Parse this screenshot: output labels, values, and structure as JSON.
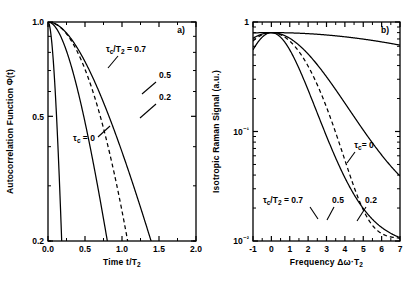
{
  "figure": {
    "panel_a_label": "a)",
    "panel_b_label": "b)"
  },
  "chart_data": [
    {
      "type": "line",
      "panel": "a)",
      "title": "",
      "xlabel": "Time t/T",
      "xlabel_sub": "2",
      "xlabel_full": "Time t/T₂",
      "ylabel": "Autocorrelation Function Φ(t)",
      "xlim": [
        0.0,
        2.0
      ],
      "ylim": [
        0.2,
        1.0
      ],
      "yscale": "log",
      "xscale": "linear",
      "grid": false,
      "xticks": [
        0.0,
        0.5,
        1.0,
        1.5,
        2.0
      ],
      "xticklabels": [
        "0.0",
        "0.5",
        "1.0",
        "1.5",
        "2.0"
      ],
      "yticks": [
        0.2,
        0.5,
        1.0
      ],
      "yticklabels": [
        "0.2",
        "0.5",
        "1.0"
      ],
      "legend_position": "inline-annotations",
      "annotations": [
        {
          "text": "τc/T2 = 0.7",
          "display": "τ",
          "x": 0.86,
          "y": 0.8
        },
        {
          "text": "0.5",
          "x": 1.48,
          "y": 0.69
        },
        {
          "text": "0.2",
          "x": 1.48,
          "y": 0.585
        },
        {
          "text": "τc = 0",
          "x": 0.4,
          "y": 0.4
        }
      ],
      "series": [
        {
          "name": "τc/T2 = 0.7",
          "tau_c": 0.7,
          "style": "solid"
        },
        {
          "name": "τc/T2 = 0.5",
          "tau_c": 0.5,
          "style": "solid"
        },
        {
          "name": "τc/T2 = 0.2",
          "tau_c": 0.2,
          "style": "solid"
        },
        {
          "name": "τc = 0",
          "tau_c": 0.0,
          "style": "dashed"
        }
      ]
    },
    {
      "type": "line",
      "panel": "b)",
      "title": "",
      "xlabel": "Frequency Δω·T",
      "xlabel_sub": "2",
      "xlabel_full": "Frequency Δω·T₂",
      "ylabel": "Isotropic Raman Signal (a.u.)",
      "xlim": [
        -1,
        7
      ],
      "ylim": [
        0.01,
        1.0
      ],
      "yscale": "log",
      "xscale": "linear",
      "grid": false,
      "xticks": [
        -1,
        0,
        1,
        2,
        3,
        4,
        5,
        6,
        7
      ],
      "xticklabels": [
        "-1",
        "0",
        "1",
        "2",
        "3",
        "4",
        "5",
        "6",
        "7"
      ],
      "yticks": [
        0.01,
        0.1,
        1.0
      ],
      "yticklabels": [
        "10⁻²",
        "10⁻¹",
        "1"
      ],
      "legend_position": "inline-annotations",
      "annotations": [
        {
          "text": "τc = 0",
          "x": 4.85,
          "y": 0.082
        },
        {
          "text": "τc/T2 = 0.7",
          "x": 0.55,
          "y": 0.026
        },
        {
          "text": "0.5",
          "x": 3.55,
          "y": 0.026
        },
        {
          "text": "0.2",
          "x": 4.95,
          "y": 0.026
        }
      ],
      "series": [
        {
          "name": "τc/T2 = 0.7",
          "tau_c": 0.7,
          "style": "solid"
        },
        {
          "name": "τc/T2 = 0.5",
          "tau_c": 0.5,
          "style": "solid"
        },
        {
          "name": "τc/T2 = 0.2",
          "tau_c": 0.2,
          "style": "solid"
        },
        {
          "name": "τc = 0",
          "tau_c": 0.0,
          "style": "dashed"
        }
      ]
    }
  ],
  "caption": {
    "text": ""
  }
}
